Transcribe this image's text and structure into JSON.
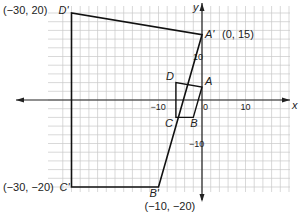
{
  "diagram": {
    "type": "coordinate-plane-dilation",
    "axes": {
      "x_label": "x",
      "y_label": "y",
      "x_range": [
        -32,
        22
      ],
      "y_range": [
        -22,
        22
      ],
      "grid_step": 2,
      "x_ticks": [
        {
          "value": -10,
          "label": "−10"
        },
        {
          "value": 0,
          "label": "0"
        },
        {
          "value": 10,
          "label": "10"
        }
      ],
      "y_ticks": [
        {
          "value": 10,
          "label": "10"
        },
        {
          "value": -10,
          "label": "−10"
        }
      ]
    },
    "original": {
      "name": "ABCD",
      "vertices": [
        {
          "label": "A",
          "x": 0,
          "y": 3
        },
        {
          "label": "B",
          "x": -2,
          "y": -4
        },
        {
          "label": "C",
          "x": -6,
          "y": -4
        },
        {
          "label": "D",
          "x": -6,
          "y": 4
        }
      ]
    },
    "image": {
      "name": "A'B'C'D'",
      "vertices": [
        {
          "label": "A'",
          "x": 0,
          "y": 15,
          "coord_label": "(0, 15)"
        },
        {
          "label": "B'",
          "x": -10,
          "y": -20,
          "coord_label": "(−10, −20)"
        },
        {
          "label": "C'",
          "x": -30,
          "y": -20,
          "coord_label": "(−30, −20)"
        },
        {
          "label": "D'",
          "x": -30,
          "y": 20,
          "coord_label": "(−30, 20)"
        }
      ]
    },
    "colors": {
      "grid": "#c8c8c8",
      "axis": "#222222",
      "shape": "#111111"
    }
  }
}
